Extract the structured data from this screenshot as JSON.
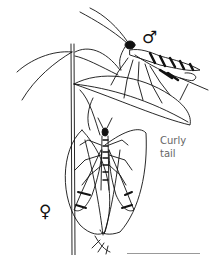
{
  "illustration": {
    "subject": "male and female insects on leaves, line drawing",
    "male_symbol": "♂",
    "female_symbol": "♀",
    "annotation_line1": "Curly",
    "annotation_line2": "tail"
  },
  "colors": {
    "ink": "#111111",
    "label": "#666666",
    "background": "#ffffff"
  }
}
